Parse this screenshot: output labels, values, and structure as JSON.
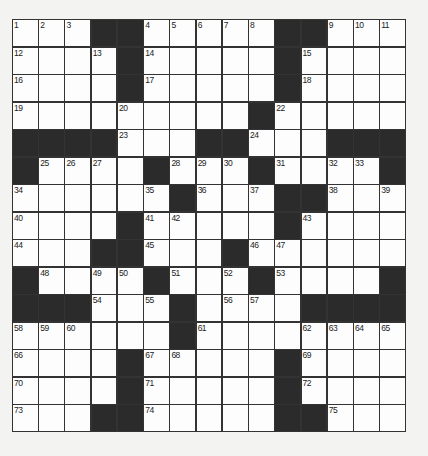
{
  "puzzle": {
    "rows": 15,
    "cols": 15,
    "colors": {
      "background": "#f3f3f2",
      "cell": "#fdfdfd",
      "block": "#2b2b2b",
      "line": "#333333"
    },
    "layout": [
      "...##.....##...",
      "....#.....#....",
      "....#.....#....",
      ".........#.....",
      "####...##...###",
      "#....#...#....#",
      "......#...##...",
      "....#.....#....",
      "...##...#......",
      "#....#...#....#",
      "###...#....####",
      "......#........",
      "....#.....#....",
      "....#.....#....",
      "...##.....##..."
    ],
    "numbers": [
      {
        "r": 0,
        "c": 0,
        "n": "1"
      },
      {
        "r": 0,
        "c": 1,
        "n": "2"
      },
      {
        "r": 0,
        "c": 2,
        "n": "3"
      },
      {
        "r": 0,
        "c": 5,
        "n": "4"
      },
      {
        "r": 0,
        "c": 6,
        "n": "5"
      },
      {
        "r": 0,
        "c": 7,
        "n": "6"
      },
      {
        "r": 0,
        "c": 8,
        "n": "7"
      },
      {
        "r": 0,
        "c": 9,
        "n": "8"
      },
      {
        "r": 0,
        "c": 12,
        "n": "9"
      },
      {
        "r": 0,
        "c": 13,
        "n": "10"
      },
      {
        "r": 0,
        "c": 14,
        "n": "11"
      },
      {
        "r": 1,
        "c": 0,
        "n": "12"
      },
      {
        "r": 1,
        "c": 3,
        "n": "13"
      },
      {
        "r": 1,
        "c": 5,
        "n": "14"
      },
      {
        "r": 1,
        "c": 11,
        "n": "15"
      },
      {
        "r": 2,
        "c": 0,
        "n": "16"
      },
      {
        "r": 2,
        "c": 5,
        "n": "17"
      },
      {
        "r": 2,
        "c": 11,
        "n": "18"
      },
      {
        "r": 3,
        "c": 0,
        "n": "19"
      },
      {
        "r": 3,
        "c": 4,
        "n": "20"
      },
      {
        "r": 3,
        "c": 9,
        "n": "21"
      },
      {
        "r": 3,
        "c": 10,
        "n": "22"
      },
      {
        "r": 4,
        "c": 4,
        "n": "23"
      },
      {
        "r": 4,
        "c": 9,
        "n": "24"
      },
      {
        "r": 5,
        "c": 1,
        "n": "25"
      },
      {
        "r": 5,
        "c": 2,
        "n": "26"
      },
      {
        "r": 5,
        "c": 3,
        "n": "27"
      },
      {
        "r": 5,
        "c": 6,
        "n": "28"
      },
      {
        "r": 5,
        "c": 7,
        "n": "29"
      },
      {
        "r": 5,
        "c": 8,
        "n": "30"
      },
      {
        "r": 5,
        "c": 10,
        "n": "31"
      },
      {
        "r": 5,
        "c": 12,
        "n": "32"
      },
      {
        "r": 5,
        "c": 13,
        "n": "33"
      },
      {
        "r": 6,
        "c": 0,
        "n": "34"
      },
      {
        "r": 6,
        "c": 5,
        "n": "35"
      },
      {
        "r": 6,
        "c": 7,
        "n": "36"
      },
      {
        "r": 6,
        "c": 9,
        "n": "37"
      },
      {
        "r": 6,
        "c": 12,
        "n": "38"
      },
      {
        "r": 6,
        "c": 14,
        "n": "39"
      },
      {
        "r": 7,
        "c": 0,
        "n": "40"
      },
      {
        "r": 7,
        "c": 5,
        "n": "41"
      },
      {
        "r": 7,
        "c": 6,
        "n": "42"
      },
      {
        "r": 7,
        "c": 11,
        "n": "43"
      },
      {
        "r": 8,
        "c": 0,
        "n": "44"
      },
      {
        "r": 8,
        "c": 5,
        "n": "45"
      },
      {
        "r": 8,
        "c": 9,
        "n": "46"
      },
      {
        "r": 8,
        "c": 10,
        "n": "47"
      },
      {
        "r": 9,
        "c": 1,
        "n": "48"
      },
      {
        "r": 9,
        "c": 3,
        "n": "49"
      },
      {
        "r": 9,
        "c": 4,
        "n": "50"
      },
      {
        "r": 9,
        "c": 6,
        "n": "51"
      },
      {
        "r": 9,
        "c": 8,
        "n": "52"
      },
      {
        "r": 9,
        "c": 10,
        "n": "53"
      },
      {
        "r": 10,
        "c": 3,
        "n": "54"
      },
      {
        "r": 10,
        "c": 5,
        "n": "55"
      },
      {
        "r": 10,
        "c": 8,
        "n": "56"
      },
      {
        "r": 10,
        "c": 9,
        "n": "57"
      },
      {
        "r": 11,
        "c": 0,
        "n": "58"
      },
      {
        "r": 11,
        "c": 1,
        "n": "59"
      },
      {
        "r": 11,
        "c": 2,
        "n": "60"
      },
      {
        "r": 11,
        "c": 7,
        "n": "61"
      },
      {
        "r": 11,
        "c": 11,
        "n": "62"
      },
      {
        "r": 11,
        "c": 12,
        "n": "63"
      },
      {
        "r": 11,
        "c": 13,
        "n": "64"
      },
      {
        "r": 11,
        "c": 14,
        "n": "65"
      },
      {
        "r": 12,
        "c": 0,
        "n": "66"
      },
      {
        "r": 12,
        "c": 5,
        "n": "67"
      },
      {
        "r": 12,
        "c": 6,
        "n": "68"
      },
      {
        "r": 12,
        "c": 11,
        "n": "69"
      },
      {
        "r": 13,
        "c": 0,
        "n": "70"
      },
      {
        "r": 13,
        "c": 5,
        "n": "71"
      },
      {
        "r": 13,
        "c": 11,
        "n": "72"
      },
      {
        "r": 14,
        "c": 0,
        "n": "73"
      },
      {
        "r": 14,
        "c": 5,
        "n": "74"
      },
      {
        "r": 14,
        "c": 12,
        "n": "75"
      }
    ]
  }
}
